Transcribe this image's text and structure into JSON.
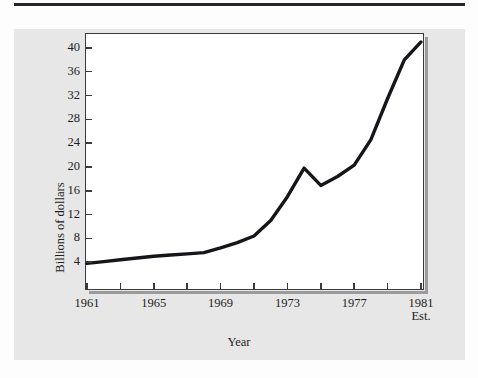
{
  "figure": {
    "background_color": "#e7e7e7",
    "plot_background": "#ffffff",
    "line_color": "#16161a",
    "axis_color": "#3a3a3f"
  },
  "chart_data": {
    "type": "line",
    "title": "",
    "xlabel": "Year",
    "ylabel": "Billions of dollars",
    "xlim": [
      1961,
      1981
    ],
    "ylim": [
      0,
      42
    ],
    "grid": false,
    "legend": null,
    "x_tick_labels": [
      "1961",
      "1965",
      "1969",
      "1973",
      "1977",
      "1981"
    ],
    "x_tick_sublabel": "Est.",
    "x_minor_ticks": [
      1961,
      1963,
      1965,
      1967,
      1969,
      1971,
      1973,
      1975,
      1977,
      1979,
      1981
    ],
    "y_tick_labels": [
      "4",
      "8",
      "12",
      "16",
      "20",
      "24",
      "28",
      "32",
      "36",
      "40"
    ],
    "y_ticks": [
      4,
      8,
      12,
      16,
      20,
      24,
      28,
      32,
      36,
      40
    ],
    "x": [
      1961,
      1962,
      1963,
      1964,
      1965,
      1966,
      1967,
      1968,
      1969,
      1970,
      1971,
      1972,
      1973,
      1974,
      1975,
      1976,
      1977,
      1978,
      1979,
      1980,
      1981
    ],
    "values": [
      3.8,
      4.1,
      4.4,
      4.7,
      5.0,
      5.2,
      5.4,
      5.6,
      6.4,
      7.3,
      8.4,
      11.0,
      15.0,
      19.8,
      16.9,
      18.4,
      20.3,
      24.6,
      31.5,
      38.0,
      41.0
    ],
    "series": [
      {
        "name": "Billions of dollars",
        "values": [
          3.8,
          4.1,
          4.4,
          4.7,
          5.0,
          5.2,
          5.4,
          5.6,
          6.4,
          7.3,
          8.4,
          11.0,
          15.0,
          19.8,
          16.9,
          18.4,
          20.3,
          24.6,
          31.5,
          38.0,
          41.0
        ]
      }
    ],
    "annotations": [
      {
        "label": "Est.",
        "x": 1981,
        "note": "1981 value is an estimate"
      }
    ]
  }
}
